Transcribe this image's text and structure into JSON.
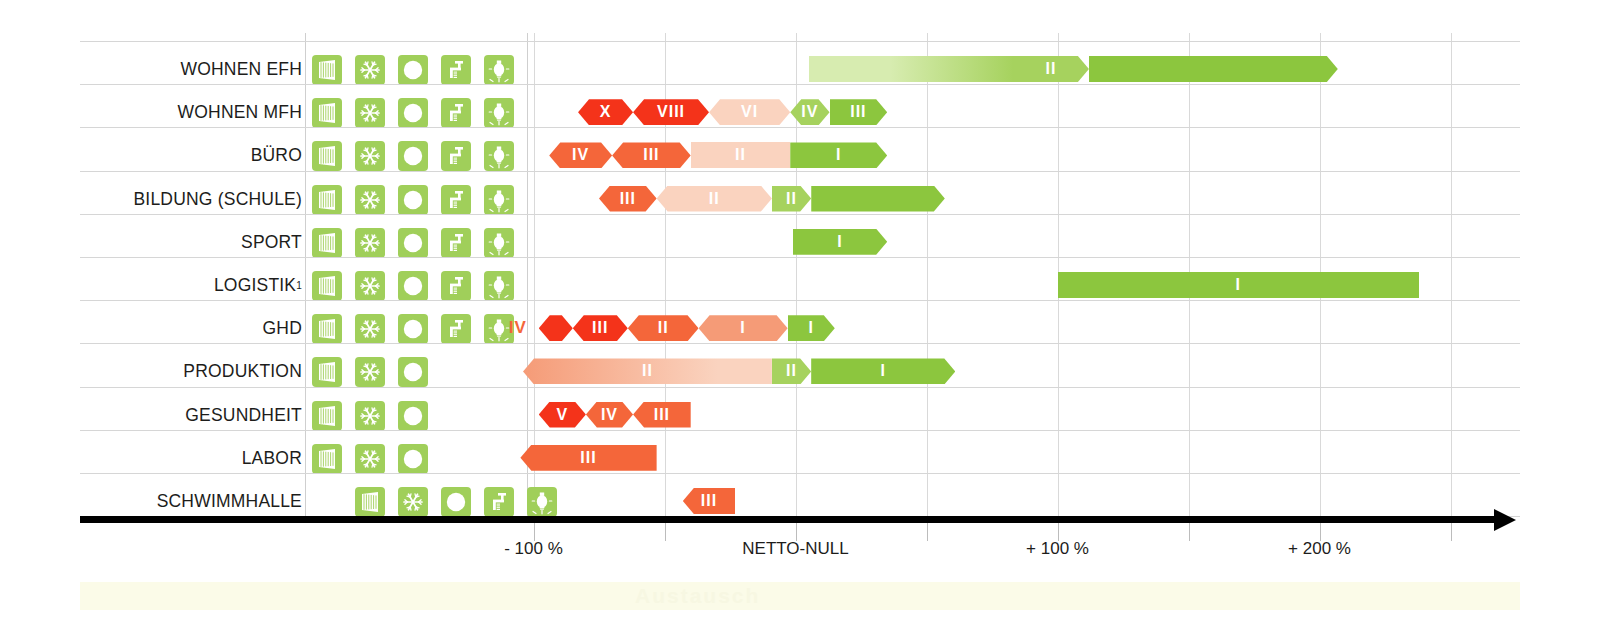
{
  "chart_data": {
    "type": "bar",
    "title": "",
    "xlabel": "",
    "ylabel": "",
    "orientation": "horizontal",
    "axis": {
      "ticks": [
        {
          "label": "- 100 %",
          "value": -100
        },
        {
          "label": "",
          "value": -50
        },
        {
          "label": "NETTO-NULL",
          "value": 0
        },
        {
          "label": "",
          "value": 50
        },
        {
          "label": "+ 100 %",
          "value": 100
        },
        {
          "label": "",
          "value": 150
        },
        {
          "label": "+ 200 %",
          "value": 200
        },
        {
          "label": "",
          "value": 250
        }
      ],
      "range": [
        -150,
        280
      ],
      "grid": true
    },
    "colors": {
      "green_solid": "#8cc63e",
      "green_light": "#d7ecb0",
      "green_mid": "#a6d25e",
      "orange": "#f4663a",
      "red": "#f4331a",
      "salmon": "#f59b77",
      "salmon_light": "#fad3bf",
      "icon_green": "#a0cf5a",
      "axis": "#000000",
      "grid": "#d9d9d9"
    },
    "icon_names": [
      "blinds-icon",
      "snowflake-icon",
      "circle-icon",
      "faucet-icon",
      "lightbulb-icon"
    ],
    "categories": [
      {
        "label": "WOHNEN EFH",
        "superscript": "",
        "icons": [
          true,
          true,
          true,
          true,
          true
        ],
        "icon_offset": 0,
        "start": 5,
        "end": 207,
        "segments": [
          {
            "numeral": "",
            "from": 5,
            "to": 83,
            "color": "gradient-green-light",
            "shape": "flat"
          },
          {
            "numeral": "II",
            "from": 83,
            "to": 112,
            "color": "green_mid",
            "shape": "arrow-r"
          },
          {
            "numeral": "",
            "from": 112,
            "to": 207,
            "color": "green_solid",
            "shape": "arrow-r"
          }
        ]
      },
      {
        "label": "WOHNEN MFH",
        "superscript": "",
        "icons": [
          true,
          true,
          true,
          true,
          true
        ],
        "icon_offset": 0,
        "start": -83,
        "end": 35,
        "segments": [
          {
            "numeral": "X",
            "from": -83,
            "to": -62,
            "color": "red",
            "shape": "arrow-both"
          },
          {
            "numeral": "VIII",
            "from": -62,
            "to": -33,
            "color": "red",
            "shape": "arrow-both"
          },
          {
            "numeral": "VI",
            "from": -33,
            "to": -2,
            "color": "salmon_light",
            "shape": "arrow-both"
          },
          {
            "numeral": "IV",
            "from": -2,
            "to": 13,
            "color": "green_mid",
            "shape": "arrow-both"
          },
          {
            "numeral": "III",
            "from": 13,
            "to": 35,
            "color": "green_solid",
            "shape": "arrow-r"
          }
        ]
      },
      {
        "label": "BÜRO",
        "superscript": "",
        "icons": [
          true,
          true,
          true,
          true,
          true
        ],
        "icon_offset": 0,
        "start": -94,
        "end": 35,
        "segments": [
          {
            "numeral": "IV",
            "from": -94,
            "to": -70,
            "color": "orange",
            "shape": "arrow-both"
          },
          {
            "numeral": "III",
            "from": -70,
            "to": -40,
            "color": "orange",
            "shape": "arrow-both"
          },
          {
            "numeral": "II",
            "from": -40,
            "to": -2,
            "color": "salmon_light",
            "shape": "flat"
          },
          {
            "numeral": "I",
            "from": -2,
            "to": 35,
            "color": "green_solid",
            "shape": "arrow-r"
          }
        ]
      },
      {
        "label": "BILDUNG (SCHULE)",
        "superscript": "",
        "icons": [
          true,
          true,
          true,
          true,
          true
        ],
        "icon_offset": 0,
        "start": -75,
        "end": 57,
        "segments": [
          {
            "numeral": "III",
            "from": -75,
            "to": -53,
            "color": "orange",
            "shape": "arrow-both"
          },
          {
            "numeral": "II",
            "from": -53,
            "to": -9,
            "color": "salmon_light",
            "shape": "arrow-both"
          },
          {
            "numeral": "II",
            "from": -9,
            "to": 6,
            "color": "green_mid",
            "shape": "arrow-r"
          },
          {
            "numeral": "",
            "from": 6,
            "to": 57,
            "color": "green_solid",
            "shape": "arrow-r"
          }
        ]
      },
      {
        "label": "SPORT",
        "superscript": "",
        "icons": [
          true,
          true,
          true,
          true,
          true
        ],
        "icon_offset": 0,
        "start": -1,
        "end": 35,
        "segments": [
          {
            "numeral": "I",
            "from": -1,
            "to": 35,
            "color": "green_solid",
            "shape": "arrow-r"
          }
        ]
      },
      {
        "label": "LOGISTIK",
        "superscript": "1",
        "icons": [
          true,
          true,
          true,
          true,
          true
        ],
        "icon_offset": 0,
        "start": 100,
        "end": 238,
        "segments": [
          {
            "numeral": "I",
            "from": 100,
            "to": 238,
            "color": "green_solid",
            "shape": "flat"
          }
        ]
      },
      {
        "label": "GHD",
        "superscript": "",
        "icons": [
          true,
          true,
          true,
          true,
          true
        ],
        "icon_offset": 0,
        "start": -98,
        "end": 15,
        "outside_label": {
          "text": "IV",
          "color": "orange"
        },
        "segments": [
          {
            "numeral": "",
            "from": -98,
            "to": -85,
            "color": "red",
            "shape": "arrow-both"
          },
          {
            "numeral": "III",
            "from": -85,
            "to": -64,
            "color": "red",
            "shape": "arrow-both"
          },
          {
            "numeral": "II",
            "from": -64,
            "to": -37,
            "color": "orange",
            "shape": "arrow-both"
          },
          {
            "numeral": "I",
            "from": -37,
            "to": -3,
            "color": "salmon",
            "shape": "arrow-both"
          },
          {
            "numeral": "I",
            "from": -3,
            "to": 15,
            "color": "green_solid",
            "shape": "arrow-r"
          }
        ]
      },
      {
        "label": "PRODUKTION",
        "superscript": "",
        "icons": [
          true,
          true,
          true,
          false,
          false
        ],
        "icon_offset": 0,
        "start": -104,
        "end": 61,
        "segments": [
          {
            "numeral": "II",
            "from": -104,
            "to": -9,
            "color": "gradient-salmon",
            "shape": "arrow-l"
          },
          {
            "numeral": "II",
            "from": -9,
            "to": 6,
            "color": "green_mid",
            "shape": "arrow-r"
          },
          {
            "numeral": "I",
            "from": 6,
            "to": 61,
            "color": "green_solid",
            "shape": "arrow-r"
          }
        ]
      },
      {
        "label": "GESUNDHEIT",
        "superscript": "",
        "icons": [
          true,
          true,
          true,
          false,
          false
        ],
        "icon_offset": 0,
        "start": -98,
        "end": -40,
        "segments": [
          {
            "numeral": "V",
            "from": -98,
            "to": -80,
            "color": "red",
            "shape": "arrow-both"
          },
          {
            "numeral": "IV",
            "from": -80,
            "to": -62,
            "color": "orange",
            "shape": "arrow-both"
          },
          {
            "numeral": "III",
            "from": -62,
            "to": -40,
            "color": "orange",
            "shape": "arrow-l"
          }
        ]
      },
      {
        "label": "LABOR",
        "superscript": "",
        "icons": [
          true,
          true,
          true,
          false,
          false
        ],
        "icon_offset": 0,
        "start": -105,
        "end": -53,
        "segments": [
          {
            "numeral": "III",
            "from": -105,
            "to": -53,
            "color": "orange",
            "shape": "arrow-l"
          }
        ]
      },
      {
        "label": "SCHWIMMHALLE",
        "superscript": "",
        "icons": [
          true,
          true,
          true,
          true,
          true
        ],
        "icon_offset": 1,
        "start": -43,
        "end": -23,
        "segments": [
          {
            "numeral": "III",
            "from": -43,
            "to": -23,
            "color": "orange",
            "shape": "arrow-l"
          }
        ]
      }
    ],
    "watermark": "Austausch"
  }
}
